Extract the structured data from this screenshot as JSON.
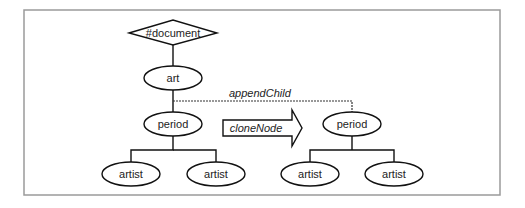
{
  "diagram": {
    "colors": {
      "stroke": "#111111",
      "frame": "#9a9a9a",
      "background": "#ffffff"
    },
    "nodes": {
      "document": {
        "label": "#document",
        "shape": "diamond"
      },
      "art": {
        "label": "art",
        "shape": "ellipse"
      },
      "period_original": {
        "label": "period",
        "shape": "ellipse"
      },
      "artist_orig_1": {
        "label": "artist",
        "shape": "ellipse"
      },
      "artist_orig_2": {
        "label": "artist",
        "shape": "ellipse"
      },
      "period_clone": {
        "label": "period",
        "shape": "ellipse"
      },
      "artist_clone_1": {
        "label": "artist",
        "shape": "ellipse"
      },
      "artist_clone_2": {
        "label": "artist",
        "shape": "ellipse"
      }
    },
    "edges": [
      {
        "from": "document",
        "to": "art",
        "style": "solid"
      },
      {
        "from": "art",
        "to": "period_original",
        "style": "solid"
      },
      {
        "from": "period_original",
        "to": "artist_orig_1",
        "style": "solid"
      },
      {
        "from": "period_original",
        "to": "artist_orig_2",
        "style": "solid"
      },
      {
        "from": "art",
        "to": "period_clone",
        "style": "dashed",
        "label": "appendChild"
      },
      {
        "from": "period_clone",
        "to": "artist_clone_1",
        "style": "solid"
      },
      {
        "from": "period_clone",
        "to": "artist_clone_2",
        "style": "solid"
      }
    ],
    "annotations": {
      "append_child": "appendChild",
      "clone_node": "cloneNode"
    }
  }
}
